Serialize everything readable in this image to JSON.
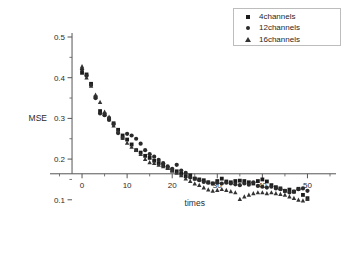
{
  "chart_data": {
    "type": "scatter",
    "title": "",
    "xlabel": "times",
    "ylabel": "MSE",
    "xlim": [
      -4,
      55
    ],
    "ylim": [
      0.07,
      0.5
    ],
    "xticks": [
      0,
      10,
      20,
      30,
      40,
      50
    ],
    "yticks": [
      0.1,
      0.2,
      0.3,
      0.4,
      0.5
    ],
    "xtick_labels": [
      "0",
      "10",
      "20",
      "30",
      "40",
      "50"
    ],
    "ytick_labels": [
      "0.1",
      "0.2",
      "0.3",
      "0.4",
      "0.5"
    ],
    "x_minor_step": 5,
    "y_minor_step": 0.05,
    "grid": false,
    "legend_position": "top-right",
    "x": [
      0,
      1,
      2,
      3,
      4,
      5,
      6,
      7,
      8,
      9,
      10,
      11,
      12,
      13,
      14,
      15,
      16,
      17,
      18,
      19,
      20,
      21,
      22,
      23,
      24,
      25,
      26,
      27,
      28,
      29,
      30,
      31,
      32,
      33,
      34,
      35,
      36,
      37,
      38,
      39,
      40,
      41,
      42,
      43,
      44,
      45,
      46,
      47,
      48,
      49,
      50
    ],
    "series": [
      {
        "name": "4channels",
        "marker": "square",
        "color": "#1b1b1b",
        "values": [
          0.412,
          0.408,
          0.385,
          0.352,
          0.318,
          0.31,
          0.3,
          0.288,
          0.272,
          0.258,
          0.248,
          0.236,
          0.222,
          0.216,
          0.208,
          0.203,
          0.196,
          0.19,
          0.185,
          0.178,
          0.172,
          0.17,
          0.164,
          0.158,
          0.16,
          0.152,
          0.15,
          0.148,
          0.143,
          0.14,
          0.146,
          0.152,
          0.145,
          0.143,
          0.146,
          0.147,
          0.146,
          0.143,
          0.14,
          0.146,
          0.15,
          0.145,
          0.136,
          0.131,
          0.128,
          0.122,
          0.125,
          0.12,
          0.127,
          0.112,
          0.104
        ]
      },
      {
        "name": "12channels",
        "marker": "circle",
        "color": "#2a2a2a",
        "values": [
          0.42,
          0.405,
          0.382,
          0.35,
          0.312,
          0.308,
          0.296,
          0.286,
          0.264,
          0.252,
          0.262,
          0.258,
          0.25,
          0.238,
          0.222,
          0.212,
          0.206,
          0.198,
          0.19,
          0.182,
          0.176,
          0.186,
          0.172,
          0.166,
          0.155,
          0.152,
          0.148,
          0.144,
          0.142,
          0.14,
          0.142,
          0.14,
          0.142,
          0.14,
          0.138,
          0.136,
          0.14,
          0.137,
          0.143,
          0.134,
          0.132,
          0.13,
          0.132,
          0.128,
          0.126,
          0.122,
          0.118,
          0.12,
          0.126,
          0.128,
          0.122
        ]
      },
      {
        "name": "16channels",
        "marker": "triangle",
        "color": "#333333",
        "values": [
          0.428,
          0.4,
          0.38,
          0.358,
          0.34,
          0.316,
          0.304,
          0.282,
          0.268,
          0.252,
          0.24,
          0.23,
          0.222,
          0.212,
          0.2,
          0.192,
          0.19,
          0.186,
          0.182,
          0.178,
          0.172,
          0.166,
          0.16,
          0.152,
          0.146,
          0.14,
          0.136,
          0.13,
          0.125,
          0.122,
          0.124,
          0.126,
          0.124,
          0.121,
          0.118,
          0.102,
          0.108,
          0.112,
          0.116,
          0.118,
          0.118,
          0.116,
          0.118,
          0.116,
          0.114,
          0.112,
          0.108,
          0.104,
          0.1,
          0.098,
          0.102
        ]
      }
    ]
  },
  "legend": {
    "items": [
      {
        "label": "4channels"
      },
      {
        "label": "12channels"
      },
      {
        "label": "16channels"
      }
    ]
  }
}
